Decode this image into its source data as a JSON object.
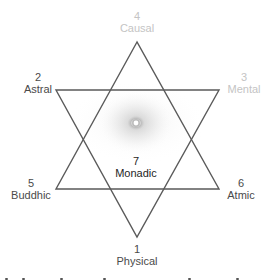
{
  "diagram": {
    "type": "hexagram",
    "colors": {
      "line": "#5a5a5a",
      "label_dark": "#4a4a4a",
      "label_faint": "#c4c4c4",
      "center_label": "#1e1e1e",
      "glow": "#bdbdbd"
    },
    "planes": [
      {
        "position": "bottom",
        "number": "1",
        "name": "Physical"
      },
      {
        "position": "upper-left",
        "number": "2",
        "name": "Astral"
      },
      {
        "position": "upper-right",
        "number": "3",
        "name": "Mental"
      },
      {
        "position": "top",
        "number": "4",
        "name": "Causal"
      },
      {
        "position": "lower-left",
        "number": "5",
        "name": "Buddhic"
      },
      {
        "position": "lower-right",
        "number": "6",
        "name": "Atmic"
      },
      {
        "position": "center",
        "number": "7",
        "name": "Monadic"
      }
    ]
  }
}
